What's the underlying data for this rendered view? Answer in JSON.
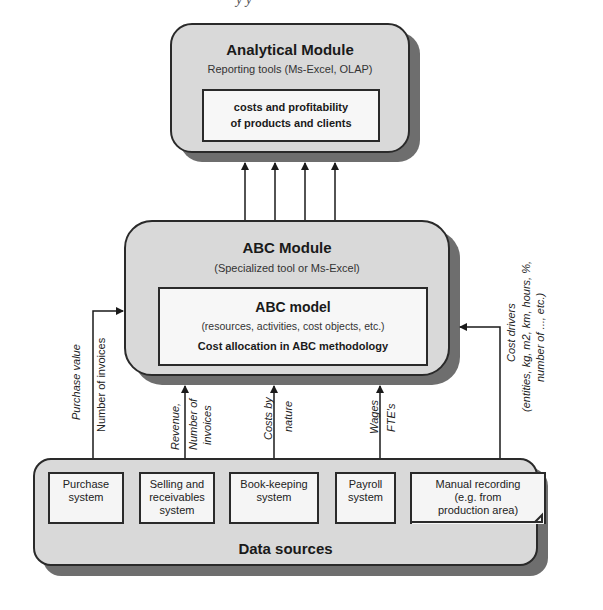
{
  "header": {
    "cropped_text": "y     y"
  },
  "analytical_module": {
    "title": "Analytical Module",
    "subtitle": "Reporting tools (Ms-Excel, OLAP)",
    "inner_line1": "costs and profitability",
    "inner_line2": "of products and clients"
  },
  "abc_module": {
    "title": "ABC Module",
    "subtitle": "(Specialized tool or Ms-Excel)",
    "inner_title": "ABC model",
    "inner_sub": "(resources, activities, cost objects, etc.)",
    "inner_bold": "Cost allocation in ABC methodology"
  },
  "flows": {
    "purchase_a": "Purchase value",
    "purchase_b": "Number of invoices",
    "selling_a": "Revenue,",
    "selling_b": "Number of",
    "selling_c": "invoices",
    "costs_a": "Costs by",
    "costs_b": "nature",
    "payroll_a": "Wages",
    "payroll_b": "FTE's",
    "drivers_a": "Cost drivers",
    "drivers_b": "(entities, kg, m2, km, hours, %,",
    "drivers_c": "number of ..., etc.)"
  },
  "data_sources": {
    "title": "Data sources",
    "systems": [
      {
        "line1": "Purchase",
        "line2": "system",
        "line3": ""
      },
      {
        "line1": "Selling and",
        "line2": "receivables",
        "line3": "system"
      },
      {
        "line1": "Book-keeping",
        "line2": "system",
        "line3": ""
      },
      {
        "line1": "Payroll",
        "line2": "system",
        "line3": ""
      },
      {
        "line1": "Manual recording",
        "line2": "(e.g. from",
        "line3": "production area)"
      }
    ]
  },
  "colors": {
    "module_fill": "#d9d9d9",
    "shadow": "#6e6e6e",
    "inner_fill": "#f7f7f7",
    "stroke": "#2a2a2a"
  }
}
